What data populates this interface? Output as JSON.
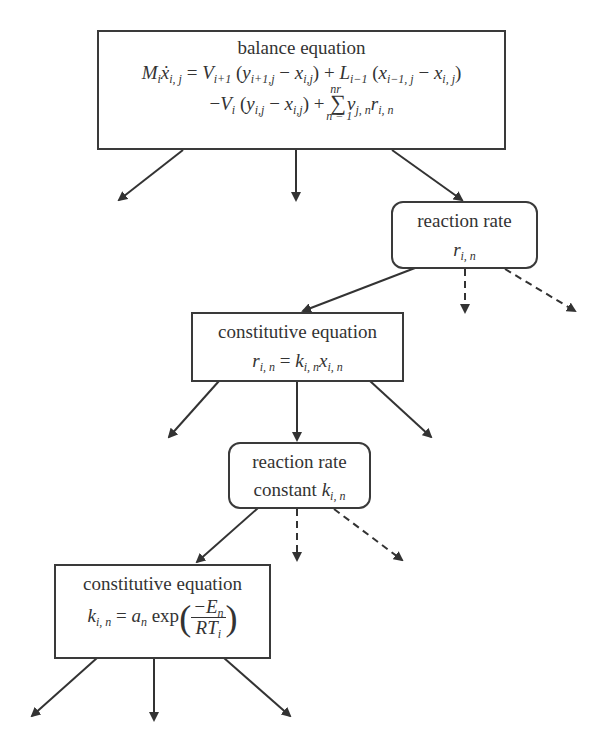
{
  "diagram": {
    "nodes": [
      {
        "id": "balance",
        "title": "balance equation",
        "equation_line1": "M_i ẋ_{i,j} = V_{i+1} (y_{i+1,j} − x_{i,j}) + L_{i−1} (x_{i−1,j} − x_{i,j})",
        "equation_line2": "−V_i (y_{i,j} − x_{i,j}) + Σ_{n=1}^{nr} ν_{j,n} r_{i,n}",
        "shape": "rectangle"
      },
      {
        "id": "reaction-rate",
        "title": "reaction rate",
        "equation": "r_{i,n}",
        "shape": "rounded-rectangle"
      },
      {
        "id": "constitutive-1",
        "title": "constitutive equation",
        "equation": "r_{i,n} = k_{i,n} x_{i,n}",
        "shape": "rectangle"
      },
      {
        "id": "rate-constant",
        "title": "reaction rate",
        "title_line2": "constant",
        "equation": "k_{i,n}",
        "shape": "rounded-rectangle"
      },
      {
        "id": "constitutive-2",
        "title": "constitutive equation",
        "equation": "k_{i,n} = a_n exp(−E_n / (R T_i))",
        "shape": "rectangle"
      }
    ],
    "text": {
      "balance_title": "balance equation",
      "rate_title": "reaction rate",
      "const1_title": "constitutive equation",
      "rateconst_title": "reaction rate",
      "rateconst_line2": "constant",
      "const2_title": "constitutive equation",
      "exp": "exp"
    },
    "edges": [
      {
        "from": "balance",
        "to": null,
        "style": "solid"
      },
      {
        "from": "balance",
        "to": null,
        "style": "solid"
      },
      {
        "from": "balance",
        "to": "reaction-rate",
        "style": "solid"
      },
      {
        "from": "reaction-rate",
        "to": "constitutive-1",
        "style": "solid"
      },
      {
        "from": "reaction-rate",
        "to": null,
        "style": "dashed"
      },
      {
        "from": "reaction-rate",
        "to": null,
        "style": "dashed"
      },
      {
        "from": "constitutive-1",
        "to": null,
        "style": "solid"
      },
      {
        "from": "constitutive-1",
        "to": "rate-constant",
        "style": "solid"
      },
      {
        "from": "constitutive-1",
        "to": null,
        "style": "solid"
      },
      {
        "from": "rate-constant",
        "to": "constitutive-2",
        "style": "solid"
      },
      {
        "from": "rate-constant",
        "to": null,
        "style": "dashed"
      },
      {
        "from": "rate-constant",
        "to": null,
        "style": "dashed"
      },
      {
        "from": "constitutive-2",
        "to": null,
        "style": "solid"
      },
      {
        "from": "constitutive-2",
        "to": null,
        "style": "solid"
      },
      {
        "from": "constitutive-2",
        "to": null,
        "style": "solid"
      }
    ],
    "colors": {
      "stroke": "#333333",
      "background": "#ffffff"
    }
  }
}
